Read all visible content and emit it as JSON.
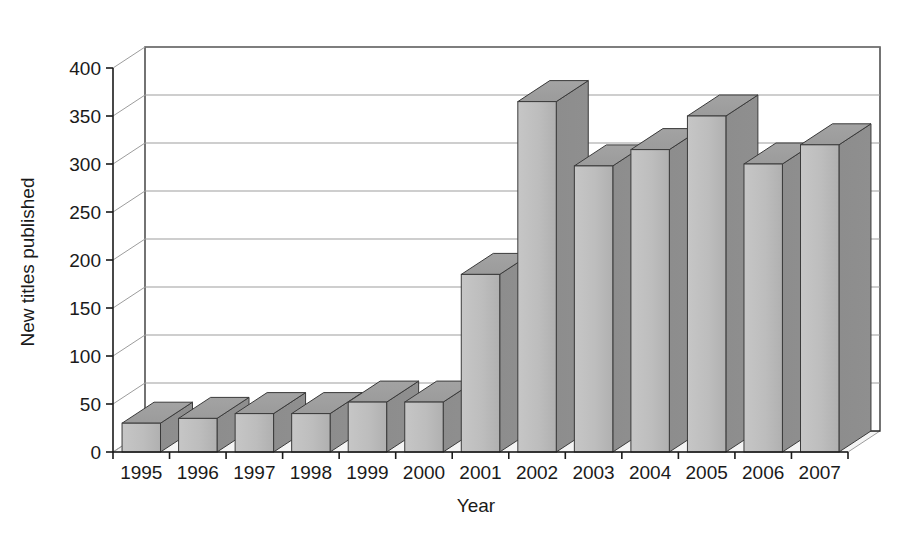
{
  "chart_data": {
    "type": "bar",
    "title": "",
    "subtitle": "",
    "xlabel": "Year",
    "ylabel": "New titles published",
    "categories": [
      "1995",
      "1996",
      "1997",
      "1998",
      "1999",
      "2000",
      "2001",
      "2002",
      "2003",
      "2004",
      "2005",
      "2006",
      "2007"
    ],
    "values": [
      30,
      35,
      40,
      40,
      52,
      52,
      185,
      365,
      298,
      315,
      350,
      300,
      320
    ],
    "series": [
      {
        "name": "New titles published",
        "values": [
          30,
          35,
          40,
          40,
          52,
          52,
          185,
          365,
          298,
          315,
          350,
          300,
          320
        ]
      }
    ],
    "ylim": [
      0,
      400
    ],
    "ytick_values": [
      0,
      50,
      100,
      150,
      200,
      250,
      300,
      350,
      400
    ],
    "ytick_labels": [
      "0",
      "50",
      "100",
      "150",
      "200",
      "250",
      "300",
      "350",
      "400"
    ],
    "xtick_labels": [
      "1995",
      "1996",
      "1997",
      "1998",
      "1999",
      "2000",
      "2001",
      "2002",
      "2003",
      "2004",
      "2005",
      "2006",
      "2007"
    ],
    "grid": true,
    "grid_axis": "y",
    "legend": false,
    "legend_position": "none",
    "style": "3d-column",
    "annotations": [],
    "colors": {
      "bar_front": "#b8b8b8",
      "bar_top": "#9a9a9a",
      "bar_side": "#8a8a8a",
      "bar_outline": "#3a3a3a",
      "floor": "#f4f4f4",
      "grid_line": "#9d9d9d",
      "axis_line": "#1a1a1a",
      "text": "#1a1a1a",
      "background": "#ffffff"
    }
  }
}
